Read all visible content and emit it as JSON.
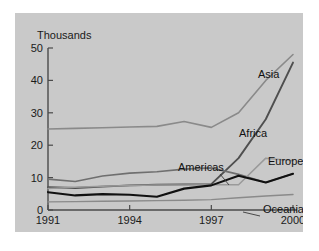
{
  "figure": {
    "background_color": "#c9c9c9",
    "page_background": "#ffffff"
  },
  "chart_data": {
    "type": "line",
    "title": "",
    "subtitle": "",
    "xlabel": "",
    "ylabel": "Thousands",
    "x": [
      1991,
      1992,
      1993,
      1994,
      1995,
      1996,
      1997,
      1998,
      1999,
      2000
    ],
    "xtick_labels": [
      "1991",
      "1994",
      "1997",
      "2000"
    ],
    "xtick_values": [
      1991,
      1994,
      1997,
      2000
    ],
    "xlim": [
      1991,
      2000
    ],
    "ytick_labels": [
      "0",
      "10",
      "20",
      "30",
      "40",
      "50"
    ],
    "ytick_values": [
      0,
      10,
      20,
      30,
      40,
      50
    ],
    "ylim": [
      0,
      50
    ],
    "grid": false,
    "legend_position": "inline-annotations",
    "series": [
      {
        "name": "Africa",
        "color": "#8a8a8a",
        "width": 1.6,
        "values": [
          25.0,
          25.2,
          25.4,
          25.6,
          25.8,
          27.3,
          25.5,
          30.0,
          40.0,
          48.0
        ],
        "label": "Africa",
        "label_x": 224,
        "label_y": 124
      },
      {
        "name": "Asia",
        "color": "#4f4f4f",
        "width": 1.9,
        "values": [
          7.0,
          6.8,
          7.2,
          7.6,
          7.8,
          7.9,
          8.0,
          16.0,
          28.0,
          45.5
        ],
        "label": "Asia",
        "label_x": 243,
        "label_y": 65
      },
      {
        "name": "Americas",
        "color": "#6f6f6f",
        "width": 1.7,
        "values": [
          9.5,
          8.8,
          10.5,
          11.4,
          11.8,
          12.6,
          13.0,
          11.0,
          8.5,
          11.2
        ],
        "label": "Americas",
        "label_x": 163,
        "label_y": 158
      },
      {
        "name": "Europe",
        "color": "#9a9a9a",
        "width": 1.5,
        "values": [
          6.6,
          7.0,
          7.3,
          7.6,
          7.7,
          7.7,
          7.8,
          7.8,
          16.0,
          15.2
        ],
        "label": "Europe",
        "label_x": 253,
        "label_y": 152
      },
      {
        "name": "Oceania",
        "color": "#8a8a8a",
        "width": 1.4,
        "values": [
          2.5,
          2.6,
          2.7,
          2.8,
          2.9,
          3.0,
          3.2,
          3.8,
          4.3,
          4.8
        ],
        "label": "Oceania",
        "label_x": 248,
        "label_y": 200
      }
    ],
    "series_black": {
      "name": "Americas",
      "color": "#111111",
      "values": [
        5.5,
        4.5,
        4.9,
        4.7,
        4.1,
        6.6,
        7.6,
        10.6,
        8.5,
        11.2
      ]
    }
  }
}
